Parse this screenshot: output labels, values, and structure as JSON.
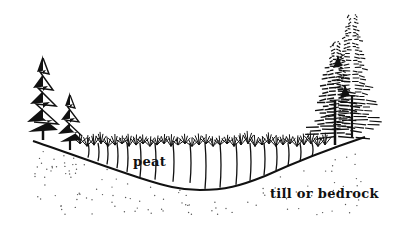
{
  "diagram": {
    "type": "cross-section illustration",
    "labels": {
      "peat": "peat",
      "substrate": "till or bedrock"
    },
    "elements": [
      {
        "name": "ground-surface-line",
        "description": "basin-shaped curve from left hill down to bog bottom and back up to right hill"
      },
      {
        "name": "peat-layer",
        "description": "region above basin filled with vertical root/stem lines topped by shrubby bog vegetation"
      },
      {
        "name": "till-bedrock-layer",
        "description": "stippled (dotted) substrate below the basin line"
      },
      {
        "name": "left-conifer-trees",
        "count": 2
      },
      {
        "name": "right-conifer-trees",
        "count": 2
      }
    ],
    "colors": {
      "ink": "#111111",
      "background": "#ffffff",
      "stipple": "#555555"
    }
  }
}
